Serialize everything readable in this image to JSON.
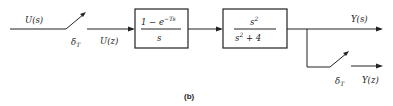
{
  "diagram": {
    "caption": "(b)",
    "input_signal": "U(s)",
    "sampled_input": "U(z)",
    "sampler_symbol": "δ",
    "sampler_subscript": "T",
    "output_signal": "Y(s)",
    "sampled_output": "Y(z)",
    "blocks": [
      {
        "name": "zero-order-hold",
        "numerator_main": "1 −  e",
        "numerator_exponent": "−Ts",
        "denominator": "s"
      },
      {
        "name": "plant",
        "numerator_main": "s",
        "numerator_exponent": "2",
        "denominator_main": "s",
        "denominator_exponent": "2",
        "denominator_tail": " + 4"
      }
    ]
  }
}
